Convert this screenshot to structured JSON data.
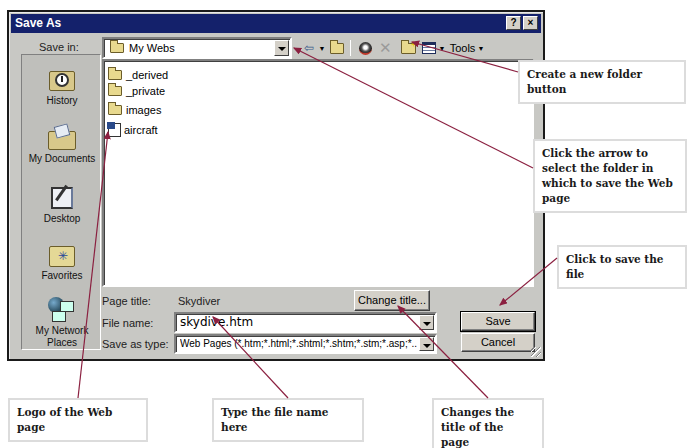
{
  "dialog": {
    "title": "Save As",
    "help_button": "?",
    "close_button": "×"
  },
  "toolbar": {
    "save_in_label": "Save in:",
    "save_in_value": "My Webs",
    "back_icon": "back-arrow-icon",
    "up_folder_icon": "up-one-level-icon",
    "search_web_icon": "search-web-icon",
    "delete_icon": "delete-icon",
    "new_folder_icon": "new-folder-icon",
    "views_icon": "views-icon",
    "tools_label": "Tools"
  },
  "places_bar": {
    "items": [
      {
        "label": "History",
        "icon": "history-icon"
      },
      {
        "label": "My Documents",
        "icon": "my-documents-icon"
      },
      {
        "label": "Desktop",
        "icon": "desktop-icon"
      },
      {
        "label": "Favorites",
        "icon": "favorites-icon"
      },
      {
        "label": "My Network Places",
        "icon": "network-places-icon"
      }
    ]
  },
  "file_list": {
    "items": [
      {
        "name": "_derived",
        "type": "folder"
      },
      {
        "name": "_private",
        "type": "folder"
      },
      {
        "name": "images",
        "type": "folder"
      },
      {
        "name": "aircraft",
        "type": "web-page"
      }
    ]
  },
  "form": {
    "page_title_label": "Page title:",
    "page_title_value": "Skydiver",
    "change_title_button": "Change title...",
    "file_name_label": "File name:",
    "file_name_value": "skydive.htm",
    "save_as_type_label": "Save as type:",
    "save_as_type_value": "Web Pages (*.htm;*.html;*.shtml;*.shtm;*.stm;*.asp;*..",
    "save_button": "Save",
    "cancel_button": "Cancel"
  },
  "callouts": {
    "new_folder": "Create a new folder button",
    "select_folder": "Click the arrow to select the folder in which to save the Web page",
    "save_file": "Click to save the file",
    "logo": "Logo of the Web page",
    "file_name": "Type the file name here",
    "change_title": "Changes the title of the page"
  },
  "colors": {
    "titlebar": "#14216b",
    "dialog_face": "#c8c8c4",
    "callout_arrow": "#8b2040"
  }
}
